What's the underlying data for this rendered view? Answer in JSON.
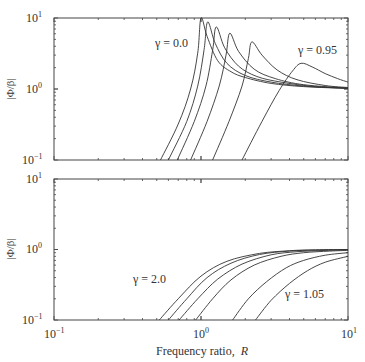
{
  "chart_data": [
    {
      "type": "line",
      "panel": "top",
      "title": "",
      "xlabel": "Frequency ratio, R",
      "ylabel": "|Φ/β|",
      "xscale": "log",
      "yscale": "log",
      "xlim": [
        0.1,
        10
      ],
      "ylim": [
        0.1,
        10
      ],
      "x_ticks": [
        "10^-1",
        "10^0",
        "10^1"
      ],
      "y_ticks": [
        "10^-1",
        "10^0",
        "10^1"
      ],
      "grid": false,
      "annotations": [
        {
          "text": "γ = 0.0",
          "x": 0.55,
          "y": 5.2
        },
        {
          "text": "γ = 0.95",
          "x": 4.2,
          "y": 4.3
        }
      ],
      "series": [
        {
          "name": "γ = 0.0",
          "peak_R": 1.0,
          "peak": 10.0,
          "x": [
            0.53,
            0.7,
            0.85,
            0.95,
            1.0,
            1.1,
            1.3,
            1.6,
            2.0,
            3.0,
            5.0,
            10.0
          ],
          "y": [
            0.1,
            0.32,
            1.0,
            3.2,
            10.0,
            5.5,
            2.5,
            1.75,
            1.45,
            1.2,
            1.08,
            1.02
          ]
        },
        {
          "name": "γ = 0.2",
          "peak_R": 1.11,
          "peak": 8.8,
          "x": [
            0.6,
            0.8,
            0.95,
            1.05,
            1.11,
            1.25,
            1.5,
            2.0,
            3.0,
            5.0,
            10.0
          ],
          "y": [
            0.1,
            0.35,
            1.1,
            3.6,
            8.8,
            4.4,
            2.3,
            1.55,
            1.25,
            1.1,
            1.02
          ]
        },
        {
          "name": "γ = 0.4",
          "peak_R": 1.27,
          "peak": 7.5,
          "x": [
            0.69,
            0.9,
            1.08,
            1.2,
            1.27,
            1.45,
            1.8,
            2.4,
            3.5,
            6.0,
            10.0
          ],
          "y": [
            0.1,
            0.35,
            1.1,
            3.5,
            7.5,
            3.8,
            2.1,
            1.5,
            1.25,
            1.08,
            1.03
          ]
        },
        {
          "name": "γ = 0.6",
          "peak_R": 1.57,
          "peak": 6.1,
          "x": [
            0.85,
            1.1,
            1.33,
            1.48,
            1.57,
            1.8,
            2.3,
            3.2,
            5.0,
            10.0
          ],
          "y": [
            0.1,
            0.35,
            1.1,
            3.0,
            6.1,
            3.4,
            1.9,
            1.4,
            1.15,
            1.03
          ]
        },
        {
          "name": "γ = 0.8",
          "peak_R": 2.22,
          "peak": 4.6,
          "x": [
            1.2,
            1.55,
            1.9,
            2.1,
            2.22,
            2.6,
            3.3,
            4.5,
            7.0,
            10.0
          ],
          "y": [
            0.1,
            0.35,
            1.1,
            2.7,
            4.6,
            3.0,
            1.85,
            1.35,
            1.12,
            1.05
          ]
        },
        {
          "name": "γ = 0.95",
          "peak_R": 4.8,
          "peak": 2.3,
          "x": [
            1.9,
            2.6,
            3.4,
            4.2,
            4.8,
            5.7,
            7.0,
            8.5,
            10.0
          ],
          "y": [
            0.1,
            0.35,
            0.95,
            1.8,
            2.3,
            2.05,
            1.65,
            1.4,
            1.25
          ]
        }
      ]
    },
    {
      "type": "line",
      "panel": "bottom",
      "title": "",
      "xlabel": "Frequency ratio, R",
      "ylabel": "|Φ/β|",
      "xscale": "log",
      "yscale": "log",
      "xlim": [
        0.1,
        10
      ],
      "ylim": [
        0.1,
        10
      ],
      "x_ticks": [
        "10^-1",
        "10^0",
        "10^1"
      ],
      "y_ticks": [
        "10^-1",
        "10^0",
        "10^1"
      ],
      "grid": false,
      "annotations": [
        {
          "text": "γ = 2.0",
          "x": 0.42,
          "y": 0.28
        },
        {
          "text": "γ = 1.05",
          "x": 3.4,
          "y": 0.17
        }
      ],
      "series": [
        {
          "name": "γ = 2.0",
          "x": [
            0.52,
            0.7,
            1.0,
            1.5,
            2.5,
            4.0,
            6.0,
            10.0
          ],
          "y": [
            0.1,
            0.2,
            0.42,
            0.68,
            0.88,
            0.96,
            0.99,
            1.0
          ]
        },
        {
          "name": "γ = 1.6",
          "x": [
            0.6,
            0.8,
            1.1,
            1.6,
            2.5,
            4.0,
            6.0,
            10.0
          ],
          "y": [
            0.1,
            0.2,
            0.4,
            0.64,
            0.85,
            0.95,
            0.98,
            1.0
          ]
        },
        {
          "name": "γ = 1.4",
          "x": [
            0.71,
            0.95,
            1.3,
            1.9,
            3.0,
            4.5,
            7.0,
            10.0
          ],
          "y": [
            0.1,
            0.2,
            0.38,
            0.62,
            0.84,
            0.93,
            0.97,
            0.99
          ]
        },
        {
          "name": "γ = 1.25",
          "x": [
            0.92,
            1.2,
            1.6,
            2.3,
            3.5,
            5.0,
            7.5,
            10.0
          ],
          "y": [
            0.1,
            0.2,
            0.37,
            0.6,
            0.8,
            0.9,
            0.95,
            0.97
          ]
        },
        {
          "name": "γ = 1.1",
          "x": [
            1.64,
            2.1,
            2.8,
            3.8,
            5.0,
            7.0,
            10.0
          ],
          "y": [
            0.1,
            0.2,
            0.35,
            0.55,
            0.7,
            0.83,
            0.9
          ]
        },
        {
          "name": "γ = 1.05",
          "x": [
            2.35,
            3.0,
            4.0,
            5.3,
            7.0,
            10.0
          ],
          "y": [
            0.1,
            0.19,
            0.33,
            0.5,
            0.66,
            0.8
          ]
        }
      ]
    }
  ],
  "labels": {
    "top_ylabel": "|Φ/β|",
    "bottom_ylabel": "|Φ/β|",
    "xlabel_text": "Frequency ratio,",
    "xlabel_var": "R",
    "top_ann_1": "γ = 0.0",
    "top_ann_2": "γ = 0.95",
    "bot_ann_1": "γ = 2.0",
    "bot_ann_2": "γ = 1.05",
    "tick_base": "10",
    "exp_neg1": "−1",
    "exp_0": "0",
    "exp_1": "1"
  }
}
